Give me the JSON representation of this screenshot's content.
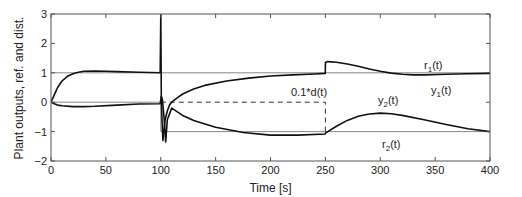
{
  "chart_data": {
    "type": "line",
    "title": "",
    "xlabel": "Time [s]",
    "ylabel": "Plant outputs, ref. and dist.",
    "xlim": [
      0,
      400
    ],
    "ylim": [
      -2,
      3
    ],
    "xticks": [
      0,
      50,
      100,
      150,
      200,
      250,
      300,
      350,
      400
    ],
    "yticks": [
      -2,
      -1,
      0,
      1,
      2,
      3
    ],
    "grid": false,
    "legend": "none (inline annotations)",
    "annotations": [
      {
        "text": "r1(t)",
        "x": 340,
        "y": 1.25
      },
      {
        "text": "y1(t)",
        "x": 352,
        "y": 0.4
      },
      {
        "text": "y2(t)",
        "x": 278,
        "y": 0.05
      },
      {
        "text": "r2(t)",
        "x": 310,
        "y": -1.5
      },
      {
        "text": "0.1*d(t)",
        "x": 225,
        "y": 0.35
      }
    ],
    "series": [
      {
        "name": "r1(t)",
        "style": "solid-thin",
        "color": "#888888",
        "x": [
          0,
          400
        ],
        "y": [
          1,
          1
        ]
      },
      {
        "name": "r2(t)",
        "style": "solid-thin",
        "color": "#888888",
        "x": [
          0,
          100,
          100,
          400
        ],
        "y": [
          0,
          0,
          -1,
          -1
        ]
      },
      {
        "name": "0.1*d(t)",
        "style": "dashed",
        "color": "#333333",
        "x": [
          100,
          250,
          250
        ],
        "y": [
          0,
          0,
          -1
        ]
      },
      {
        "name": "y1(t)",
        "style": "solid-thick",
        "color": "#111111",
        "x": [
          0,
          3,
          6,
          10,
          15,
          20,
          25,
          30,
          40,
          50,
          60,
          80,
          99.5,
          100,
          100.5,
          101,
          102,
          104,
          106,
          108,
          110,
          115,
          120,
          130,
          140,
          160,
          180,
          200,
          220,
          240,
          249.9,
          250,
          252,
          260,
          270,
          280,
          290,
          300,
          310,
          320,
          330,
          340,
          360,
          380,
          400
        ],
        "y": [
          0,
          0.25,
          0.5,
          0.72,
          0.88,
          0.97,
          1.02,
          1.05,
          1.06,
          1.05,
          1.04,
          1.02,
          1.0,
          3.0,
          0.2,
          -0.4,
          -1.3,
          -0.6,
          -0.3,
          -0.1,
          0.0,
          0.15,
          0.28,
          0.45,
          0.57,
          0.72,
          0.82,
          0.89,
          0.93,
          0.96,
          0.98,
          1.35,
          1.38,
          1.36,
          1.3,
          1.22,
          1.13,
          1.05,
          0.99,
          0.95,
          0.93,
          0.93,
          0.95,
          0.97,
          0.98
        ]
      },
      {
        "name": "y2(t)",
        "style": "solid-thick",
        "color": "#111111",
        "x": [
          0,
          3,
          6,
          10,
          20,
          30,
          40,
          60,
          80,
          99.5,
          100.5,
          101.5,
          103,
          104.5,
          106,
          110,
          120,
          130,
          150,
          175,
          200,
          225,
          249.9,
          250,
          260,
          270,
          280,
          290,
          300,
          310,
          320,
          340,
          360,
          380,
          400
        ],
        "y": [
          0,
          -0.05,
          -0.1,
          -0.12,
          -0.15,
          -0.15,
          -0.14,
          -0.1,
          -0.06,
          -0.05,
          0.2,
          0.1,
          -0.5,
          -1.35,
          -0.6,
          -0.2,
          -0.45,
          -0.62,
          -0.85,
          -1.03,
          -1.12,
          -1.12,
          -1.08,
          -1.05,
          -0.82,
          -0.62,
          -0.48,
          -0.4,
          -0.37,
          -0.39,
          -0.45,
          -0.6,
          -0.76,
          -0.9,
          -1.0
        ]
      }
    ]
  },
  "labels": {
    "xlabel": "Time [s]",
    "ylabel": "Plant outputs, ref. and dist.",
    "r1": "r",
    "r1_sub": "1",
    "y1": "y",
    "y1_sub": "1",
    "y2": "y",
    "y2_sub": "2",
    "r2": "r",
    "r2_sub": "2",
    "t_suffix": "(t)",
    "dist": "0.1*d(t)"
  }
}
